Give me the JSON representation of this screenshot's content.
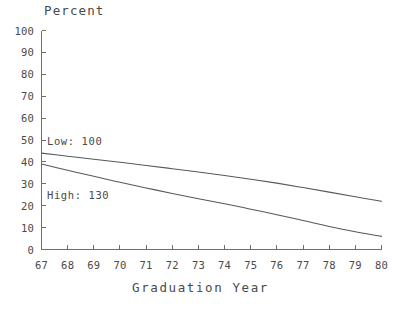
{
  "chart_data": {
    "type": "line",
    "title": "",
    "xlabel": "Graduation Year",
    "ylabel": "Percent",
    "xlim": [
      67,
      80
    ],
    "ylim": [
      0,
      100
    ],
    "grid": false,
    "legend_position": "inline-annotation",
    "x": [
      67,
      68,
      69,
      70,
      71,
      72,
      73,
      74,
      75,
      76,
      77,
      78,
      79,
      80
    ],
    "xticks": [
      "67",
      "68",
      "69",
      "70",
      "71",
      "72",
      "73",
      "74",
      "75",
      "76",
      "77",
      "78",
      "79",
      "80"
    ],
    "yticks": [
      "0",
      "10",
      "20",
      "30",
      "40",
      "50",
      "60",
      "70",
      "80",
      "90",
      "100"
    ],
    "series": [
      {
        "name": "Low: 100",
        "label": "Low: 100",
        "color": "#55585c",
        "values": [
          44,
          42.6,
          41.2,
          39.8,
          38.4,
          36.9,
          35.4,
          33.8,
          32.1,
          30.3,
          28.3,
          26.2,
          24.1,
          22
        ]
      },
      {
        "name": "High: 130",
        "label": "High: 130",
        "color": "#55585c",
        "values": [
          39,
          36.2,
          33.4,
          30.7,
          28.1,
          25.6,
          23.2,
          20.9,
          18.4,
          15.9,
          13.2,
          10.5,
          8.1,
          6
        ]
      }
    ],
    "annotations": [
      {
        "text": "Low: 100",
        "x": 67.2,
        "y": 51
      },
      {
        "text": "High: 130",
        "x": 67.2,
        "y": 26
      }
    ]
  },
  "axis": {
    "y_title": "Percent",
    "x_title": "Graduation Year"
  },
  "colors": {
    "axis": "#6e6e6e",
    "line": "#55585c",
    "text": "#4a4a4a",
    "background": "#ffffff"
  }
}
